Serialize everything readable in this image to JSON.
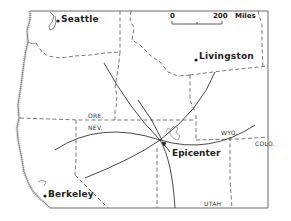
{
  "map": {
    "type": "seismic epicenter location map",
    "region": "Western United States",
    "cities": [
      {
        "name": "Seattle"
      },
      {
        "name": "Livingston"
      },
      {
        "name": "Berkeley"
      }
    ],
    "states": [
      {
        "abbr": "ORE."
      },
      {
        "abbr": "NEV."
      },
      {
        "abbr": "WYO."
      },
      {
        "abbr": "COLO."
      },
      {
        "abbr": "UTAH"
      }
    ],
    "epicenter_label": "Epicenter",
    "scale": {
      "start": "0",
      "end": "200",
      "unit": "Miles"
    },
    "colors": {
      "line": "#333333",
      "border": "#555555",
      "background": "#ffffff"
    }
  }
}
